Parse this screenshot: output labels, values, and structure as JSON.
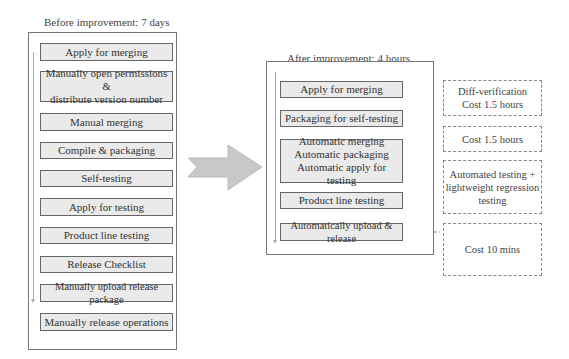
{
  "before": {
    "title": "Before improvement: 7 days",
    "steps": [
      "Apply for merging",
      "Manually open permissions &\ndistribute version number",
      "Manual merging",
      "Compile & packaging",
      "Self-testing",
      "Apply for testing",
      "Product line testing",
      "Release Checklist",
      "Manually upload release package",
      "Manually release operations"
    ]
  },
  "transition_arrow": "right-arrow",
  "after": {
    "title": "After improvement: 4 hours",
    "steps": [
      "Apply for merging",
      "Packaging for self-testing",
      "Automatic merging\nAutomatic packaging\nAutomatic apply for testing",
      "Product line testing",
      "Automatically upload & release"
    ],
    "notes": [
      "Diff-verification\nCost 1.5 hours",
      "Cost 1.5 hours",
      "Automated testing +\nlightweight regression\ntesting",
      "Cost 10 mins"
    ]
  },
  "colors": {
    "step_fill": "#eaeaea",
    "step_border": "#666666",
    "arrow_fill": "#c8c8c8",
    "note_border": "#888888"
  }
}
